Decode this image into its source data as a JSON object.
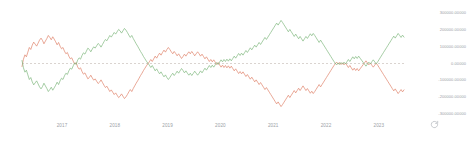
{
  "chart_data": {
    "type": "line",
    "title": "",
    "subtitle": "",
    "xlabel": "",
    "ylabel": "",
    "grid": false,
    "legend_position": "none",
    "background": "#ffffff",
    "zero_line": {
      "value": 0,
      "style": "dashed",
      "color": "#b5a9a0"
    },
    "ylim": [
      -350000,
      350000
    ],
    "yticks": [
      300000,
      200000,
      100000,
      0,
      -100000,
      -200000,
      -300000
    ],
    "ytick_labels": [
      "300000.00000",
      "200000.00000",
      "100000.00000",
      "0.00000",
      "-100000.00000",
      "-200000.00000",
      "-300000.00000"
    ],
    "xlim": [
      "2016-07",
      "2023-03"
    ],
    "xtick_labels": [
      "2017",
      "2018",
      "2019",
      "2020",
      "2021",
      "2022",
      "2023"
    ],
    "series": [
      {
        "name": "series-red",
        "color": "#e0836a",
        "values": [
          -18000,
          26000,
          52000,
          40000,
          68000,
          96000,
          84000,
          110000,
          128000,
          116000,
          104000,
          122000,
          140000,
          152000,
          138000,
          118000,
          134000,
          150000,
          168000,
          156000,
          142000,
          160000,
          146000,
          130000,
          112000,
          126000,
          104000,
          88000,
          96000,
          74000,
          58000,
          66000,
          44000,
          28000,
          34000,
          14000,
          -4000,
          6000,
          -20000,
          -34000,
          -26000,
          -48000,
          -64000,
          -56000,
          -74000,
          -92000,
          -84000,
          -70000,
          -86000,
          -100000,
          -92000,
          -106000,
          -120000,
          -112000,
          -98000,
          -114000,
          -130000,
          -144000,
          -136000,
          -152000,
          -168000,
          -158000,
          -172000,
          -186000,
          -176000,
          -190000,
          -204000,
          -196000,
          -182000,
          -196000,
          -210000,
          -200000,
          -186000,
          -170000,
          -156000,
          -168000,
          -150000,
          -134000,
          -118000,
          -104000,
          -88000,
          -72000,
          -58000,
          -42000,
          -28000,
          -14000,
          -2000,
          10000,
          24000,
          12000,
          28000,
          44000,
          32000,
          48000,
          62000,
          50000,
          66000,
          80000,
          68000,
          84000,
          96000,
          84000,
          70000,
          58000,
          72000,
          60000,
          46000,
          58000,
          44000,
          30000,
          42000,
          56000,
          44000,
          58000,
          70000,
          58000,
          72000,
          60000,
          46000,
          58000,
          70000,
          58000,
          44000,
          56000,
          42000,
          28000,
          40000,
          26000,
          12000,
          24000,
          10000,
          22000,
          8000,
          -6000,
          6000,
          -8000,
          -22000,
          -10000,
          -24000,
          -12000,
          -26000,
          -14000,
          -28000,
          -16000,
          -30000,
          -44000,
          -32000,
          -46000,
          -60000,
          -48000,
          -62000,
          -50000,
          -64000,
          -78000,
          -66000,
          -80000,
          -94000,
          -82000,
          -96000,
          -110000,
          -98000,
          -112000,
          -126000,
          -114000,
          -128000,
          -142000,
          -156000,
          -144000,
          -158000,
          -172000,
          -186000,
          -200000,
          -214000,
          -228000,
          -242000,
          -230000,
          -244000,
          -258000,
          -246000,
          -232000,
          -218000,
          -204000,
          -190000,
          -204000,
          -190000,
          -176000,
          -162000,
          -176000,
          -162000,
          -148000,
          -162000,
          -148000,
          -134000,
          -148000,
          -162000,
          -150000,
          -164000,
          -178000,
          -166000,
          -180000,
          -168000,
          -154000,
          -140000,
          -126000,
          -140000,
          -126000,
          -112000,
          -98000,
          -84000,
          -70000,
          -56000,
          -42000,
          -28000,
          -14000,
          -2000,
          8000,
          -4000,
          6000,
          -6000,
          4000,
          -8000,
          2000,
          -10000,
          -24000,
          -12000,
          -26000,
          -40000,
          -28000,
          -42000,
          -30000,
          -44000,
          -32000,
          -20000,
          -8000,
          4000,
          16000,
          4000,
          -8000,
          2000,
          -10000,
          -22000,
          -10000,
          2000,
          -10000,
          -24000,
          -38000,
          -52000,
          -66000,
          -80000,
          -94000,
          -108000,
          -122000,
          -136000,
          -150000,
          -164000,
          -152000,
          -166000,
          -180000,
          -168000,
          -156000,
          -170000,
          -158000
        ]
      },
      {
        "name": "series-green",
        "color": "#7fb77e",
        "mirror_of": "series-red",
        "values": [
          18000,
          -26000,
          -52000,
          -40000,
          -68000,
          -96000,
          -84000,
          -110000,
          -128000,
          -116000,
          -104000,
          -122000,
          -140000,
          -152000,
          -138000,
          -118000,
          -134000,
          -150000,
          -168000,
          -156000,
          -142000,
          -160000,
          -146000,
          -130000,
          -112000,
          -126000,
          -104000,
          -88000,
          -96000,
          -74000,
          -58000,
          -66000,
          -44000,
          -28000,
          -34000,
          -14000,
          4000,
          -6000,
          20000,
          34000,
          26000,
          48000,
          64000,
          56000,
          74000,
          92000,
          84000,
          70000,
          86000,
          100000,
          92000,
          106000,
          120000,
          112000,
          98000,
          114000,
          130000,
          144000,
          136000,
          152000,
          168000,
          158000,
          172000,
          186000,
          176000,
          190000,
          204000,
          196000,
          182000,
          196000,
          210000,
          200000,
          186000,
          170000,
          156000,
          168000,
          150000,
          134000,
          118000,
          104000,
          88000,
          72000,
          58000,
          42000,
          28000,
          14000,
          2000,
          -10000,
          -24000,
          -12000,
          -28000,
          -44000,
          -32000,
          -48000,
          -62000,
          -50000,
          -66000,
          -80000,
          -68000,
          -84000,
          -96000,
          -84000,
          -70000,
          -58000,
          -72000,
          -60000,
          -46000,
          -58000,
          -44000,
          -30000,
          -42000,
          -56000,
          -44000,
          -58000,
          -70000,
          -58000,
          -72000,
          -60000,
          -46000,
          -58000,
          -70000,
          -58000,
          -44000,
          -56000,
          -42000,
          -28000,
          -40000,
          -26000,
          -12000,
          -24000,
          -10000,
          -22000,
          -8000,
          6000,
          -6000,
          8000,
          22000,
          10000,
          24000,
          12000,
          26000,
          14000,
          28000,
          16000,
          30000,
          44000,
          32000,
          46000,
          60000,
          48000,
          62000,
          50000,
          64000,
          78000,
          66000,
          80000,
          94000,
          82000,
          96000,
          110000,
          98000,
          112000,
          126000,
          114000,
          128000,
          142000,
          156000,
          144000,
          158000,
          172000,
          186000,
          200000,
          214000,
          228000,
          242000,
          230000,
          244000,
          258000,
          246000,
          232000,
          218000,
          204000,
          190000,
          204000,
          190000,
          176000,
          162000,
          176000,
          162000,
          148000,
          162000,
          148000,
          134000,
          148000,
          162000,
          150000,
          164000,
          178000,
          166000,
          180000,
          168000,
          154000,
          140000,
          126000,
          140000,
          126000,
          112000,
          98000,
          84000,
          70000,
          56000,
          42000,
          28000,
          14000,
          2000,
          -8000,
          4000,
          -6000,
          6000,
          -4000,
          8000,
          -2000,
          10000,
          24000,
          12000,
          26000,
          40000,
          28000,
          42000,
          30000,
          44000,
          32000,
          20000,
          8000,
          -4000,
          -16000,
          -4000,
          8000,
          -2000,
          10000,
          22000,
          10000,
          -2000,
          10000,
          24000,
          38000,
          52000,
          66000,
          80000,
          94000,
          108000,
          122000,
          136000,
          150000,
          164000,
          152000,
          166000,
          180000,
          168000,
          156000,
          170000,
          158000
        ]
      }
    ],
    "annotations": []
  },
  "axis": {
    "y_tick_labels": [
      "300000.00000",
      "200000.00000",
      "100000.00000",
      "0.00000",
      "-100000.00000",
      "-200000.00000",
      "-300000.00000"
    ],
    "x_tick_labels": [
      "2017",
      "2018",
      "2019",
      "2020",
      "2021",
      "2022",
      "2023"
    ]
  },
  "controls": {
    "refresh_icon": "refresh-icon"
  }
}
